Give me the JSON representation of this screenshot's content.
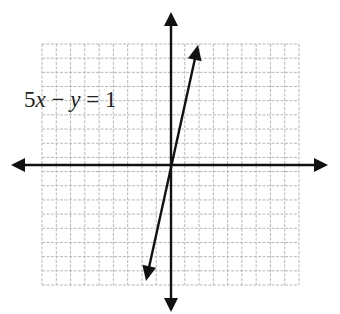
{
  "equation": {
    "coef_x": "5",
    "var_x": "x",
    "minus": " − ",
    "var_y": "y",
    "equals": " = ",
    "rhs": "1",
    "full_text": "5x − y = 1"
  },
  "grid": {
    "left": 42,
    "top": 44,
    "right": 299,
    "bottom": 285,
    "cols": 18,
    "rows": 17,
    "line_color": "#b8b8b8"
  },
  "axes": {
    "origin_px": [
      171,
      165
    ],
    "x_axis": {
      "from": [
        11,
        165
      ],
      "to": [
        328,
        165
      ]
    },
    "y_axis": {
      "from": [
        171,
        12
      ],
      "to": [
        171,
        312
      ]
    },
    "color": "#111111"
  },
  "line": {
    "slope": 5,
    "y_intercept": -1,
    "from_px": [
      146,
      281
    ],
    "to_px": [
      198,
      45
    ],
    "color": "#111111"
  },
  "chart_data": {
    "type": "line",
    "title": "",
    "annotation": "5x − y = 1",
    "xlabel": "",
    "ylabel": "",
    "xlim": [
      -9,
      9
    ],
    "ylim": [
      -8.5,
      8.5
    ],
    "grid": true,
    "series": [
      {
        "name": "5x − y = 1",
        "x": [
          -1.75,
          0,
          0.2,
          1.9
        ],
        "y": [
          -9.75,
          -1,
          0,
          8.5
        ]
      }
    ]
  }
}
